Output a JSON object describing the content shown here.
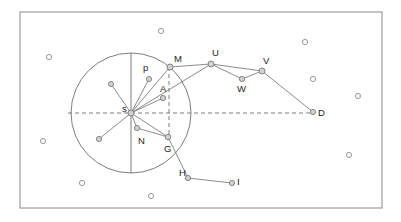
{
  "diagram": {
    "canvas": {
      "width": 401,
      "height": 222,
      "background": "#ffffff"
    },
    "frame": {
      "x": 20,
      "y": 12,
      "width": 362,
      "height": 196,
      "stroke": "#8a8a8a"
    },
    "circle": {
      "cx": 131,
      "cy": 113,
      "r": 60,
      "stroke": "#6e6e6e"
    },
    "axes": {
      "vertical_solid": {
        "x": 131,
        "y1": 53,
        "y2": 173
      },
      "horizontal_dashed": {
        "y": 113,
        "x1": 68,
        "x2": 312
      },
      "vertical_dashed": {
        "x": 169,
        "y1": 67,
        "y2": 137
      }
    },
    "colors": {
      "stroke": "#6e6e6e",
      "node_fill": "#d2d2d2",
      "scatter_fill": "#ffffff",
      "frame": "#8a8a8a",
      "label": "#1d1d1d"
    },
    "labeled_nodes": [
      {
        "id": "s",
        "label": "s",
        "x": 131,
        "y": 113,
        "r": 3.0,
        "lx": 122,
        "ly": 112
      },
      {
        "id": "p",
        "label": "p",
        "x": 149,
        "y": 79,
        "r": 2.6,
        "lx": 143,
        "ly": 71
      },
      {
        "id": "M",
        "label": "M",
        "x": 170,
        "y": 67,
        "r": 3.0,
        "lx": 174,
        "ly": 62
      },
      {
        "id": "A",
        "label": "A",
        "x": 163,
        "y": 98,
        "r": 2.6,
        "lx": 160,
        "ly": 92
      },
      {
        "id": "U",
        "label": "U",
        "x": 211,
        "y": 64,
        "r": 3.0,
        "lx": 212,
        "ly": 56
      },
      {
        "id": "V",
        "label": "V",
        "x": 262,
        "y": 71,
        "r": 3.0,
        "lx": 263,
        "ly": 64
      },
      {
        "id": "W",
        "label": "W",
        "x": 242,
        "y": 79,
        "r": 2.6,
        "lx": 237,
        "ly": 92
      },
      {
        "id": "D",
        "label": "D",
        "x": 313,
        "y": 112,
        "r": 2.6,
        "lx": 318,
        "ly": 116
      },
      {
        "id": "N",
        "label": "N",
        "x": 137,
        "y": 128,
        "r": 2.6,
        "lx": 138,
        "ly": 144
      },
      {
        "id": "G",
        "label": "G",
        "x": 168,
        "y": 137,
        "r": 2.8,
        "lx": 164,
        "ly": 152
      },
      {
        "id": "H",
        "label": "H",
        "x": 188,
        "y": 178,
        "r": 2.6,
        "lx": 179,
        "ly": 176
      },
      {
        "id": "I",
        "label": "I",
        "x": 232,
        "y": 183,
        "r": 2.6,
        "lx": 237,
        "ly": 185
      }
    ],
    "spoke_endpoints": [
      {
        "id": "spoke-upper-left",
        "x": 111,
        "y": 84,
        "r": 2.6
      },
      {
        "id": "spoke-lower-left",
        "x": 99,
        "y": 139,
        "r": 2.6
      }
    ],
    "edges": [
      {
        "from": "s",
        "to": "p"
      },
      {
        "from": "s",
        "to": "M"
      },
      {
        "from": "s",
        "to": "A"
      },
      {
        "from": "s",
        "to": "N"
      },
      {
        "from": "s",
        "to": "G"
      },
      {
        "from": "s",
        "to": "U"
      },
      {
        "from": "s",
        "to": "spoke-upper-left"
      },
      {
        "from": "s",
        "to": "spoke-lower-left"
      },
      {
        "from": "N",
        "to": "G"
      },
      {
        "from": "M",
        "to": "U"
      },
      {
        "from": "U",
        "to": "W"
      },
      {
        "from": "U",
        "to": "V"
      },
      {
        "from": "W",
        "to": "V"
      },
      {
        "from": "V",
        "to": "D"
      },
      {
        "from": "G",
        "to": "H"
      },
      {
        "from": "H",
        "to": "I"
      }
    ],
    "scatter_points": [
      {
        "x": 161,
        "y": 31
      },
      {
        "x": 49,
        "y": 57
      },
      {
        "x": 305,
        "y": 42
      },
      {
        "x": 313,
        "y": 79
      },
      {
        "x": 358,
        "y": 96
      },
      {
        "x": 43,
        "y": 141
      },
      {
        "x": 349,
        "y": 155
      },
      {
        "x": 82,
        "y": 183
      },
      {
        "x": 151,
        "y": 196
      }
    ]
  }
}
